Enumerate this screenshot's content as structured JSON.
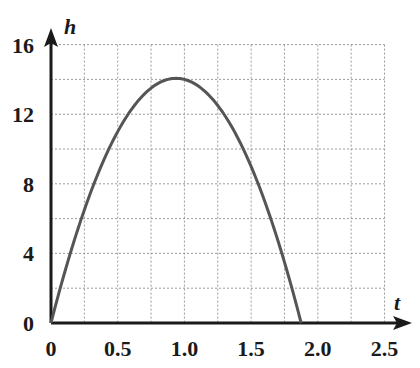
{
  "chart_data": {
    "type": "line",
    "title": "",
    "xlabel": "t",
    "ylabel": "h",
    "xlim": [
      0,
      2.5
    ],
    "ylim": [
      0,
      16
    ],
    "grid": true,
    "grid_style": "dotted",
    "x_ticks": [
      "0",
      "0.5",
      "1.0",
      "1.5",
      "2.0",
      "2.5"
    ],
    "y_ticks": [
      "0",
      "4",
      "8",
      "12",
      "16"
    ],
    "x_grid_step": 0.25,
    "y_grid_step": 2,
    "series": [
      {
        "name": "h(t)",
        "description": "parabolic height curve, approx h = 30t - 16t^2",
        "x": [
          0,
          0.125,
          0.25,
          0.375,
          0.5,
          0.625,
          0.75,
          0.875,
          0.9375,
          1.0,
          1.125,
          1.25,
          1.375,
          1.5,
          1.625,
          1.75,
          1.875
        ],
        "values": [
          0,
          3.5,
          6.5,
          9.0,
          11.0,
          12.5,
          13.5,
          14.0,
          14.06,
          14.0,
          13.5,
          12.5,
          11.0,
          9.0,
          6.5,
          3.5,
          0
        ]
      }
    ],
    "annotations": {
      "peak": {
        "t": 0.94,
        "h": 14
      },
      "root": {
        "t": 1.875,
        "h": 0
      }
    },
    "colors": {
      "curve": "#555555",
      "axis": "#1a1a1a",
      "grid": "#9a9a9a"
    }
  }
}
